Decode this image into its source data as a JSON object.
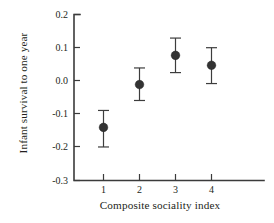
{
  "chart_data": {
    "type": "scatter",
    "title": "",
    "subtitle": "",
    "xlabel": "Composite sociality index",
    "ylabel": "Infant survival to one year",
    "categories": [
      "1",
      "2",
      "3",
      "4"
    ],
    "x": [
      1,
      2,
      3,
      4
    ],
    "values": [
      -0.14,
      -0.011,
      0.077,
      0.047
    ],
    "error_low": [
      -0.199,
      -0.059,
      0.025,
      -0.008
    ],
    "error_high": [
      -0.089,
      0.039,
      0.129,
      0.1
    ],
    "xtick_labels": [
      "1",
      "2",
      "3",
      "4"
    ],
    "ytick_labels": [
      "0.2",
      "0.1",
      "0.0",
      "-0.1",
      "-0.2",
      "-0.3"
    ],
    "ytick_values": [
      0.2,
      0.1,
      0.0,
      -0.1,
      -0.2,
      -0.3
    ],
    "xlim": [
      0.45,
      4.75
    ],
    "ylim": [
      -0.3,
      0.2
    ],
    "grid": false,
    "legend": null,
    "legend_position": "none",
    "marker": "filled-circle",
    "marker_color": "#333333",
    "errorbar_color": "#3d3d3d",
    "axis_color": "#3b3b3b",
    "background_color": "#ffffff",
    "annotations": []
  }
}
